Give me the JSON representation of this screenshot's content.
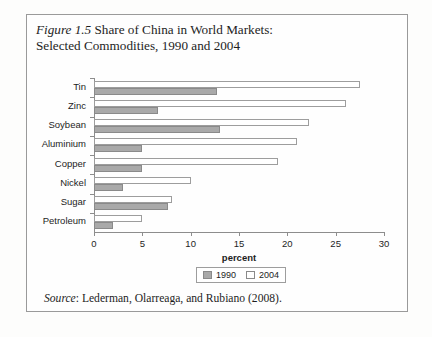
{
  "figure": {
    "number": "Figure 1.5",
    "title": " Share of China in World Markets:",
    "subtitle": "Selected Commodities, 1990 and 2004",
    "source_label": "Source",
    "source_text": ": Lederman, Olarreaga, and Rubiano (2008)."
  },
  "legend": {
    "items": [
      {
        "label": "1990",
        "color": "#a9a9a9"
      },
      {
        "label": "2004",
        "color": "#ffffff"
      }
    ]
  },
  "chart_data": {
    "type": "bar",
    "orientation": "horizontal",
    "title": "Figure 1.5 Share of China in World Markets: Selected Commodities, 1990 and 2004",
    "xlabel": "percent",
    "ylabel": "",
    "xlim": [
      0,
      30
    ],
    "xticks": [
      0,
      5,
      10,
      15,
      20,
      25,
      30
    ],
    "grid": false,
    "legend_position": "bottom-center",
    "categories": [
      "Tin",
      "Zinc",
      "Soybean",
      "Aluminium",
      "Copper",
      "Nickel",
      "Sugar",
      "Petroleum"
    ],
    "series": [
      {
        "name": "1990",
        "color": "#a9a9a9",
        "values": [
          12.7,
          6.6,
          13.0,
          5.0,
          5.0,
          3.0,
          7.7,
          2.0
        ]
      },
      {
        "name": "2004",
        "color": "#ffffff",
        "values": [
          27.5,
          26.1,
          22.2,
          21.0,
          19.0,
          10.0,
          8.1,
          5.0
        ]
      }
    ]
  }
}
